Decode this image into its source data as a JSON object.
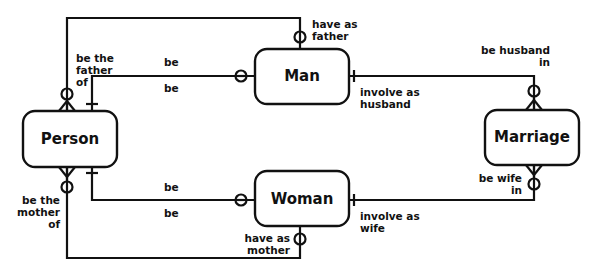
{
  "diagram": {
    "type": "entity-relationship",
    "entities": [
      {
        "id": "person",
        "label": "Person"
      },
      {
        "id": "man",
        "label": "Man"
      },
      {
        "id": "woman",
        "label": "Woman"
      },
      {
        "id": "marriage",
        "label": "Marriage"
      }
    ],
    "relationships": [
      {
        "id": "person-man-subtype",
        "from": "person",
        "to": "man",
        "from_label": "be",
        "to_label": "be"
      },
      {
        "id": "person-woman-subtype",
        "from": "person",
        "to": "woman",
        "from_label": "be",
        "to_label": "be"
      },
      {
        "id": "person-father",
        "from": "person",
        "to": "man",
        "from_label": "be the father of",
        "to_label": "have as father"
      },
      {
        "id": "person-mother",
        "from": "person",
        "to": "woman",
        "from_label": "be the mother of",
        "to_label": "have as mother"
      },
      {
        "id": "man-marriage",
        "from": "man",
        "to": "marriage",
        "from_label": "involve as husband",
        "to_label": "be husband in"
      },
      {
        "id": "woman-marriage",
        "from": "woman",
        "to": "marriage",
        "from_label": "involve as wife",
        "to_label": "be wife in"
      }
    ],
    "labels": {
      "father_of_l1": "be the",
      "father_of_l2": "father",
      "father_of_l3": "of",
      "mother_of_l1": "be the",
      "mother_of_l2": "mother",
      "mother_of_l3": "of",
      "have_father_l1": "have as",
      "have_father_l2": "father",
      "have_mother_l1": "have as",
      "have_mother_l2": "mother",
      "man_be_top": "be",
      "man_be_bottom": "be",
      "woman_be_top": "be",
      "woman_be_bottom": "be",
      "inv_husband_l1": "involve as",
      "inv_husband_l2": "husband",
      "inv_wife_l1": "involve as",
      "inv_wife_l2": "wife",
      "husband_in_l1": "be husband",
      "husband_in_l2": "in",
      "wife_in_l1": "be wife",
      "wife_in_l2": "in"
    }
  }
}
